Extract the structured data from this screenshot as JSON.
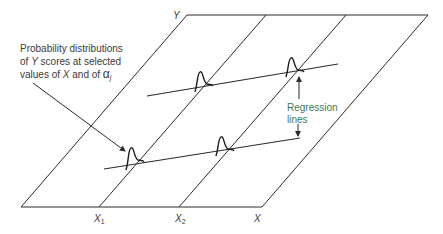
{
  "diagram": {
    "axes": {
      "y_label": "Y",
      "x_label": "X",
      "x1_label": "X",
      "x1_sub": "1",
      "x2_label": "X",
      "x2_sub": "2"
    },
    "annotation": {
      "line1": "Probability distributions",
      "line2_pre": "of ",
      "line2_y": "Y",
      "line2_post": " scores at selected",
      "line3_pre": "values of ",
      "line3_x": "X",
      "line3_mid": " and of ",
      "line3_alpha": "α",
      "line3_sub": "j"
    },
    "regression_label": {
      "line1": "Regression",
      "line2": "lines"
    },
    "colors": {
      "lines": "#2b2b2b",
      "label_text": "#3a3a3a",
      "regression_text": "#3a7a5a"
    }
  }
}
